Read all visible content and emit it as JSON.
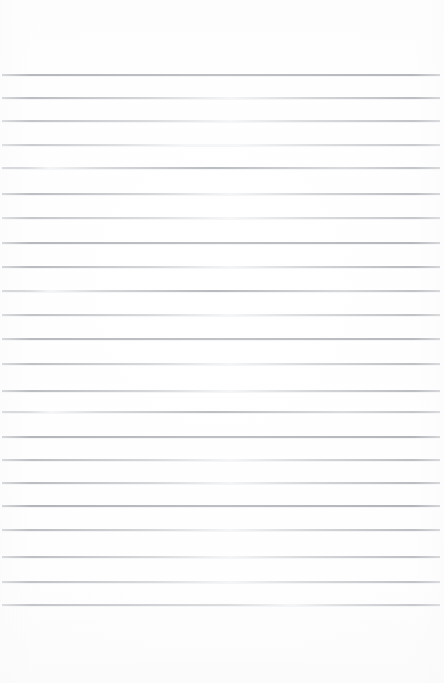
{
  "page": {
    "kind": "ruled-notepad-page",
    "width": 444,
    "height": 683,
    "content_text": "",
    "paper_color": "#fefefe",
    "paper_edge_color": "#fafafb",
    "rule_color": "#a9acb1",
    "rule_color_light": "#c8cbd0"
  },
  "ruling": {
    "line_count": 23,
    "first_line_y": 75,
    "last_line_y": 605,
    "line_spacing": 24.1,
    "line_thickness": 1.5,
    "line_left_x": 2,
    "line_right_x": 440,
    "top_margin_height": 75,
    "bottom_margin_height": 78,
    "lines": [
      {
        "y": 75,
        "opacity": 0.92,
        "fade": "none"
      },
      {
        "y": 98,
        "opacity": 0.88,
        "fade": "mid"
      },
      {
        "y": 121,
        "opacity": 0.78,
        "fade": "mid"
      },
      {
        "y": 145,
        "opacity": 0.7,
        "fade": "strong"
      },
      {
        "y": 168,
        "opacity": 0.8,
        "fade": "left"
      },
      {
        "y": 194,
        "opacity": 0.86,
        "fade": "mid"
      },
      {
        "y": 218,
        "opacity": 0.74,
        "fade": "mid"
      },
      {
        "y": 243,
        "opacity": 0.88,
        "fade": "none"
      },
      {
        "y": 267,
        "opacity": 0.9,
        "fade": "mid"
      },
      {
        "y": 291,
        "opacity": 0.84,
        "fade": "left"
      },
      {
        "y": 315,
        "opacity": 0.8,
        "fade": "mid"
      },
      {
        "y": 339,
        "opacity": 0.86,
        "fade": "none"
      },
      {
        "y": 364,
        "opacity": 0.82,
        "fade": "mid"
      },
      {
        "y": 391,
        "opacity": 0.88,
        "fade": "mid"
      },
      {
        "y": 412,
        "opacity": 0.78,
        "fade": "left"
      },
      {
        "y": 437,
        "opacity": 0.9,
        "fade": "none"
      },
      {
        "y": 460,
        "opacity": 0.84,
        "fade": "mid"
      },
      {
        "y": 483,
        "opacity": 0.88,
        "fade": "mid"
      },
      {
        "y": 506,
        "opacity": 0.92,
        "fade": "none"
      },
      {
        "y": 530,
        "opacity": 0.86,
        "fade": "mid"
      },
      {
        "y": 557,
        "opacity": 0.84,
        "fade": "mid"
      },
      {
        "y": 582,
        "opacity": 0.8,
        "fade": "mid"
      },
      {
        "y": 605,
        "opacity": 0.82,
        "fade": "right"
      }
    ]
  }
}
